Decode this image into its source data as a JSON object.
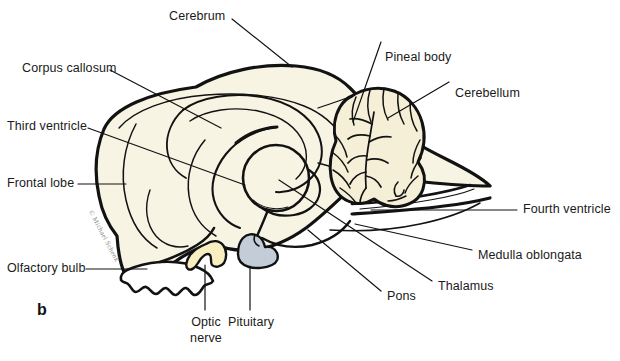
{
  "figure": {
    "panel_letter": "b",
    "watermark": "© Michael Schenk",
    "colors": {
      "background": "#ffffff",
      "brain_fill": "#f7f4e3",
      "cerebellum_fill": "#f4efd6",
      "optic_nerve_fill": "#f7efc2",
      "pituitary_fill": "#c3cdd8",
      "outline": "#121212",
      "leader_line": "#121212",
      "text": "#1a1a1a",
      "watermark_text": "#8c8c86"
    }
  },
  "labels": {
    "cerebrum": "Cerebrum",
    "corpus_callosum": "Corpus callosum",
    "third_ventricle": "Third ventricle",
    "frontal_lobe": "Frontal lobe",
    "olfactory_bulb": "Olfactory bulb",
    "pineal_body": "Pineal body",
    "cerebellum": "Cerebellum",
    "fourth_ventricle": "Fourth ventricle",
    "medulla_oblongata": "Medulla oblongata",
    "thalamus": "Thalamus",
    "pons": "Pons",
    "optic_nerve_line1": "Optic",
    "optic_nerve_line2": "nerve",
    "pituitary": "Pituitary"
  }
}
